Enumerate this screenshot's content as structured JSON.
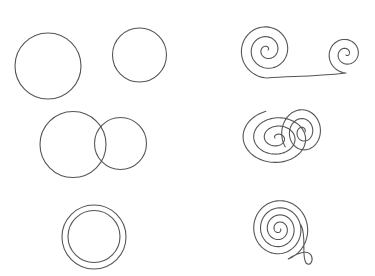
{
  "canvas": {
    "width": 375,
    "height": 276,
    "background": "#ffffff",
    "stroke_color": "#555555",
    "stroke_width": 1.1
  },
  "left_column": {
    "label": "circles",
    "shapes": [
      {
        "name": "large-circle",
        "type": "circle",
        "cx": 48,
        "cy": 66,
        "r": 33
      },
      {
        "name": "small-circle",
        "type": "circle",
        "cx": 139.5,
        "cy": 55,
        "r": 27
      },
      {
        "name": "venn-left-circle",
        "type": "circle",
        "cx": 73,
        "cy": 144.5,
        "r": 33
      },
      {
        "name": "venn-right-circle",
        "type": "circle",
        "cx": 120.5,
        "cy": 143.5,
        "r": 26
      },
      {
        "name": "ring-outer-circle",
        "type": "circle",
        "cx": 94,
        "cy": 237,
        "r": 32
      },
      {
        "name": "ring-inner-circle",
        "type": "circle",
        "cx": 94,
        "cy": 236.5,
        "r": 26
      }
    ]
  },
  "right_column": {
    "label": "spirals",
    "shapes": [
      {
        "name": "double-spiral",
        "type": "double-spiral",
        "left_center": [
          267,
          50
        ],
        "right_center": [
          346,
          54
        ]
      },
      {
        "name": "overlapping-spirals",
        "type": "overlapping-spirals",
        "centers": [
          [
            277,
            138
          ],
          [
            303,
            132
          ]
        ]
      },
      {
        "name": "looped-spiral",
        "type": "looped-spiral",
        "center": [
          279,
          229
        ]
      }
    ]
  }
}
